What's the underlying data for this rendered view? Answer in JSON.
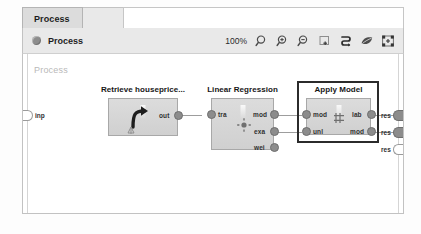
{
  "window": {
    "tab_label": "Process"
  },
  "toolbar": {
    "panel_icon": "circle-icon",
    "panel_title": "Process",
    "zoom_level": "100%",
    "buttons": [
      {
        "name": "zoom-reset-icon",
        "label": "Zoom"
      },
      {
        "name": "zoom-in-icon",
        "label": "Zoom In"
      },
      {
        "name": "zoom-out-icon",
        "label": "Zoom Out"
      },
      {
        "name": "add-panel-icon",
        "label": "Add"
      },
      {
        "name": "auto-arrange-icon",
        "label": "Auto Arrange"
      },
      {
        "name": "leaf-icon",
        "label": "Leaf"
      },
      {
        "name": "fit-screen-icon",
        "label": "Fit to Screen"
      }
    ]
  },
  "canvas": {
    "watermark": "Process",
    "input_ports": [
      {
        "name": "inp",
        "label": "inp",
        "state": "hollow"
      }
    ],
    "result_ports": [
      {
        "name": "res-1",
        "label": "res",
        "state": "filled"
      },
      {
        "name": "res-2",
        "label": "res",
        "state": "filled"
      },
      {
        "name": "res-3",
        "label": "res",
        "state": "hollow"
      }
    ],
    "operators": [
      {
        "id": "retrieve-houseprices",
        "title": "Retrieve houseprice...",
        "icon": "retrieve-arrow-icon",
        "selected": false,
        "inputs": [],
        "outputs": [
          {
            "label": "out",
            "state": "filled"
          }
        ]
      },
      {
        "id": "linear-regression",
        "title": "Linear Regression",
        "icon": "regression-icon",
        "selected": false,
        "inputs": [
          {
            "label": "tra",
            "state": "filled"
          }
        ],
        "outputs": [
          {
            "label": "mod",
            "state": "filled"
          },
          {
            "label": "exa",
            "state": "filled"
          },
          {
            "label": "wei",
            "state": "filled"
          }
        ]
      },
      {
        "id": "apply-model",
        "title": "Apply Model",
        "icon": "apply-model-icon",
        "selected": true,
        "inputs": [
          {
            "label": "mod",
            "state": "filled"
          },
          {
            "label": "unl",
            "state": "filled"
          }
        ],
        "outputs": [
          {
            "label": "lab",
            "state": "filled"
          },
          {
            "label": "mod",
            "state": "filled"
          }
        ]
      }
    ]
  }
}
